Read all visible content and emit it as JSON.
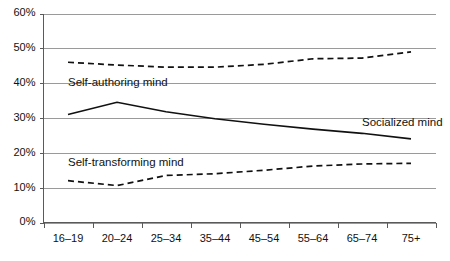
{
  "chart_data": {
    "type": "line",
    "title": "",
    "subtitle": "",
    "xlabel": "",
    "ylabel": "",
    "categories": [
      "16–19",
      "20–24",
      "25–34",
      "35–44",
      "45–54",
      "55–64",
      "65–74",
      "75+"
    ],
    "ylim": [
      0,
      60
    ],
    "ytick_labels": [
      "0%",
      "10%",
      "20%",
      "30%",
      "40%",
      "50%",
      "60%"
    ],
    "ytick_values": [
      0,
      10,
      20,
      30,
      40,
      50,
      60
    ],
    "grid": true,
    "legend_position": "inline-annotations",
    "series": [
      {
        "name": "Self-authoring mind",
        "style": "dashed",
        "values": [
          46.0,
          45.2,
          44.6,
          44.6,
          45.4,
          47.0,
          47.2,
          49.0
        ],
        "label_x_category": "16–19",
        "label_value": 41.5,
        "label_anchor": "start"
      },
      {
        "name": "Socialized mind",
        "style": "solid",
        "values": [
          31.0,
          34.5,
          31.8,
          29.8,
          28.2,
          26.8,
          25.6,
          24.0
        ],
        "label_x_category": "65–74",
        "label_value": 30.0,
        "label_anchor": "start"
      },
      {
        "name": "Self-transforming mind",
        "style": "dashed",
        "values": [
          12.0,
          10.6,
          13.5,
          14.0,
          15.0,
          16.2,
          16.8,
          17.0
        ],
        "label_x_category": "16–19",
        "label_value": 18.6,
        "label_anchor": "start"
      }
    ]
  },
  "annotations": {
    "self_authoring_label": "Self-authoring mind",
    "socialized_label": "Socialized mind",
    "self_transforming_label": "Self-transforming mind"
  },
  "colors": {
    "line": "#111111",
    "grid": "#9a9a9a",
    "axis": "#5a5a5a",
    "background": "#ffffff",
    "text": "#111111"
  }
}
